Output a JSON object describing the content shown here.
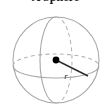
{
  "figure": {
    "title": "A Sphere",
    "caption_color": "#1a1a1a",
    "background_color": "#ffffff"
  },
  "diagram": {
    "type": "sphere-with-radius",
    "shape_name": "sphere",
    "outline_color": "#a8a8a8",
    "hidden_edge_color": "#b4b4b4",
    "radius_line_color": "#2b2b2b",
    "center_dot_color": "#000000",
    "labels": {
      "radius": "r"
    },
    "geometry": {
      "center_x": 56,
      "center_y": 60,
      "radius_px": 43,
      "dot_radius_px": 3.2,
      "radius_end_x": 88,
      "radius_end_y": 76,
      "radius_label_x": 66,
      "radius_label_y": 78,
      "equator_rx": 43,
      "equator_ry": 12,
      "equator_cy": 66,
      "meridian_rx": 16,
      "meridian_ry": 43
    }
  }
}
